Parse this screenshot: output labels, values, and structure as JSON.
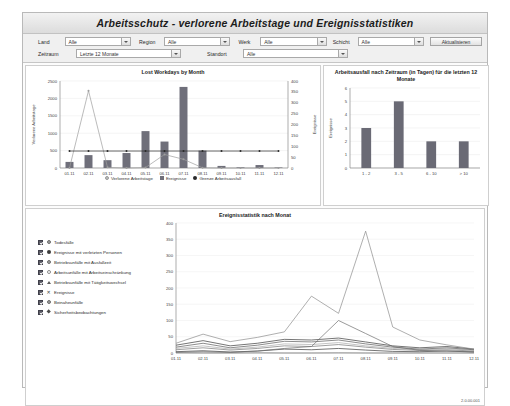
{
  "header": {
    "title": "Arbeitsschutz - verlorene Arbeitstage und Ereignisstatistiken"
  },
  "filters": {
    "land": {
      "label": "Land",
      "value": "Alle"
    },
    "region": {
      "label": "Region",
      "value": "Alle"
    },
    "werk": {
      "label": "Werk",
      "value": "Alle"
    },
    "schicht": {
      "label": "Schicht",
      "value": "Alle"
    },
    "zeitraum": {
      "label": "Zeitraum",
      "value": "Letzte 12 Monate"
    },
    "standort": {
      "label": "Standort",
      "value": "Alle"
    },
    "refresh_label": "Aktualisieren"
  },
  "footer": {
    "version": "2.0.00.001"
  },
  "chart_data": [
    {
      "type": "bar",
      "id": "lost-workdays",
      "title": "Lost Workdays by Month",
      "xlabel": "",
      "ylabel": "Verlorene Arbeitstage",
      "y2label": "Ereignisse",
      "ylim": [
        0,
        2500
      ],
      "y2lim": [
        0,
        400
      ],
      "yticks": [
        0,
        500,
        1000,
        1500,
        2000,
        2500
      ],
      "y2ticks": [
        0,
        50,
        100,
        150,
        200,
        250,
        300,
        350,
        400
      ],
      "grid": true,
      "legend_position": "bottom",
      "categories": [
        "01.11",
        "02.11",
        "03.11",
        "04.11",
        "05.11",
        "06.11",
        "07.11",
        "08.11",
        "09.11",
        "10.11",
        "11.11",
        "12.11"
      ],
      "series": [
        {
          "name": "Ereignisse",
          "kind": "bar",
          "axis": "left",
          "color": "#6f6f7a",
          "values": [
            175,
            370,
            225,
            430,
            1060,
            760,
            2330,
            500,
            60,
            20,
            85,
            15
          ]
        },
        {
          "name": "Verlorene Arbeitstage",
          "kind": "line",
          "axis": "right",
          "color": "#9e9e9e",
          "values": [
            0,
            355,
            3,
            0,
            2,
            62,
            40,
            1,
            0,
            0,
            0,
            0
          ]
        },
        {
          "name": "Grenze Arbeitsausfall",
          "kind": "line",
          "axis": "right",
          "color": "#2a2a2a",
          "values": [
            78,
            78,
            78,
            78,
            78,
            78,
            78,
            78,
            78,
            78,
            78,
            78
          ]
        }
      ],
      "legend": [
        "Verlorene Arbeitstage",
        "Ereignisse",
        "Grenze Arbeitsausfall"
      ]
    },
    {
      "type": "bar",
      "id": "ausfall-zeitraum",
      "title": "Arbeitsausfall nach Zeitraum (in Tagen) für die letzten 12 Monate",
      "xlabel": "",
      "ylabel": "Ereignisse",
      "ylim": [
        0,
        6
      ],
      "yticks": [
        0,
        1,
        2,
        3,
        4,
        5,
        6
      ],
      "grid": true,
      "categories": [
        "1 - 2",
        "3 - 5",
        "6 - 10",
        "> 10"
      ],
      "values": [
        3,
        5,
        2,
        2
      ],
      "color": "#6a6a75"
    },
    {
      "type": "line",
      "id": "ereignisstatistik",
      "title": "Ereignisstatistik nach Monat",
      "xlabel": "",
      "ylabel": "",
      "ylim": [
        0,
        400
      ],
      "yticks": [
        0,
        50,
        100,
        150,
        200,
        250,
        300,
        350,
        400
      ],
      "grid": true,
      "legend_position": "left",
      "categories": [
        "01.11",
        "02.11",
        "03.11",
        "04.11",
        "05.11",
        "06.11",
        "07.11",
        "08.11",
        "09.11",
        "10.11",
        "11.11",
        "12.11"
      ],
      "series": [
        {
          "name": "Todesfälle",
          "marker": "circle",
          "color": "#9e9e9e",
          "checked": true,
          "values": [
            1,
            0,
            0,
            1,
            0,
            0,
            1,
            0,
            0,
            0,
            0,
            0
          ]
        },
        {
          "name": "Ereignisse mit verletzten Personen",
          "marker": "filled-circle",
          "color": "#3a3a3a",
          "checked": true,
          "values": [
            4,
            7,
            3,
            6,
            12,
            10,
            14,
            9,
            5,
            4,
            6,
            3
          ]
        },
        {
          "name": "Betriebsunfälle mit Ausfallzeit",
          "marker": "circle-ring",
          "color": "#777777",
          "checked": true,
          "values": [
            10,
            16,
            9,
            14,
            22,
            20,
            26,
            18,
            11,
            8,
            10,
            6
          ]
        },
        {
          "name": "Arbeitsunfälle mit Arbeitseinschränkung",
          "marker": "open-circle",
          "color": "#aaaaaa",
          "checked": true,
          "values": [
            14,
            22,
            12,
            18,
            28,
            26,
            32,
            22,
            14,
            10,
            13,
            8
          ]
        },
        {
          "name": "Betriebsunfälle mit Tätigkeitswechsel",
          "marker": "triangle",
          "color": "#5a5a5a",
          "checked": true,
          "values": [
            18,
            30,
            16,
            24,
            36,
            34,
            40,
            28,
            18,
            12,
            16,
            10
          ]
        },
        {
          "name": "Ereignisse",
          "marker": "x",
          "color": "#3a3a3a",
          "checked": true,
          "values": [
            24,
            38,
            22,
            30,
            42,
            40,
            46,
            34,
            22,
            16,
            20,
            12
          ]
        },
        {
          "name": "Beinaheunfälle",
          "marker": "circle-ring",
          "color": "#6f6f6f",
          "checked": true,
          "values": [
            2,
            4,
            2,
            6,
            14,
            20,
            100,
            60,
            20,
            8,
            6,
            4
          ]
        },
        {
          "name": "Sicherheitsbeobachtungen",
          "marker": "diamond",
          "color": "#8c8c8c",
          "checked": true,
          "values": [
            30,
            58,
            35,
            48,
            65,
            175,
            122,
            375,
            80,
            40,
            25,
            12
          ]
        }
      ]
    }
  ]
}
